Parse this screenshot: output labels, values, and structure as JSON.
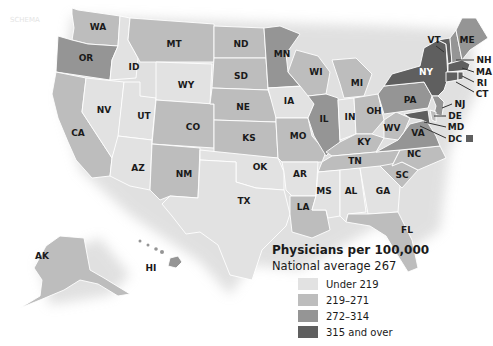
{
  "colors": {
    "c1": "#e2e2e2",
    "c2": "#bdbdbd",
    "c3": "#959595",
    "c4": "#5f5f5f",
    "shadow": "#d8d8d8"
  },
  "legend": {
    "title": "Physicians per 100,000",
    "subtitle": "National average 267",
    "items": [
      {
        "label": "Under 219",
        "color": "#e2e2e2"
      },
      {
        "label": "219–271",
        "color": "#bdbdbd"
      },
      {
        "label": "272–314",
        "color": "#959595"
      },
      {
        "label": "315 and over",
        "color": "#5f5f5f"
      }
    ]
  },
  "states": {
    "WA": "WA",
    "OR": "OR",
    "CA": "CA",
    "ID": "ID",
    "NV": "NV",
    "UT": "UT",
    "AZ": "AZ",
    "MT": "MT",
    "WY": "WY",
    "CO": "CO",
    "NM": "NM",
    "ND": "ND",
    "SD": "SD",
    "NE": "NE",
    "KS": "KS",
    "OK": "OK",
    "TX": "TX",
    "MN": "MN",
    "IA": "IA",
    "MO": "MO",
    "AR": "AR",
    "LA": "LA",
    "WI": "WI",
    "IL": "IL",
    "MI": "MI",
    "IN": "IN",
    "OH": "OH",
    "KY": "KY",
    "TN": "TN",
    "MS": "MS",
    "AL": "AL",
    "GA": "GA",
    "FL": "FL",
    "SC": "SC",
    "NC": "NC",
    "VA": "VA",
    "WV": "WV",
    "PA": "PA",
    "NY": "NY",
    "VT": "VT",
    "NH": "NH",
    "ME": "ME",
    "MA": "MA",
    "RI": "RI",
    "CT": "CT",
    "NJ": "NJ",
    "DE": "DE",
    "MD": "MD",
    "DC": "DC",
    "AK": "AK",
    "HI": "HI"
  },
  "state_categories": {
    "WA": "219–271",
    "OR": "272–314",
    "CA": "219–271",
    "ID": "Under 219",
    "NV": "Under 219",
    "UT": "Under 219",
    "AZ": "Under 219",
    "MT": "219–271",
    "WY": "Under 219",
    "CO": "219–271",
    "NM": "219–271",
    "ND": "219–271",
    "SD": "219–271",
    "NE": "219–271",
    "KS": "219–271",
    "OK": "Under 219",
    "TX": "Under 219",
    "MN": "272–314",
    "IA": "Under 219",
    "MO": "219–271",
    "AR": "Under 219",
    "LA": "219–271",
    "WI": "219–271",
    "IL": "272–314",
    "MI": "219–271",
    "IN": "Under 219",
    "OH": "219–271",
    "KY": "219–271",
    "TN": "219–271",
    "MS": "Under 219",
    "AL": "Under 219",
    "GA": "Under 219",
    "FL": "219–271",
    "SC": "219–271",
    "NC": "219–271",
    "VA": "272–314",
    "WV": "219–271",
    "PA": "272–314",
    "NY": "315 and over",
    "VT": "315 and over",
    "NH": "272–314",
    "ME": "272–314",
    "MA": "315 and over",
    "RI": "315 and over",
    "CT": "315 and over",
    "NJ": "272–314",
    "DE": "219–271",
    "MD": "315 and over",
    "DC": "315 and over",
    "AK": "219–271",
    "HI": "272–314"
  },
  "watermark": "SCHEMA"
}
